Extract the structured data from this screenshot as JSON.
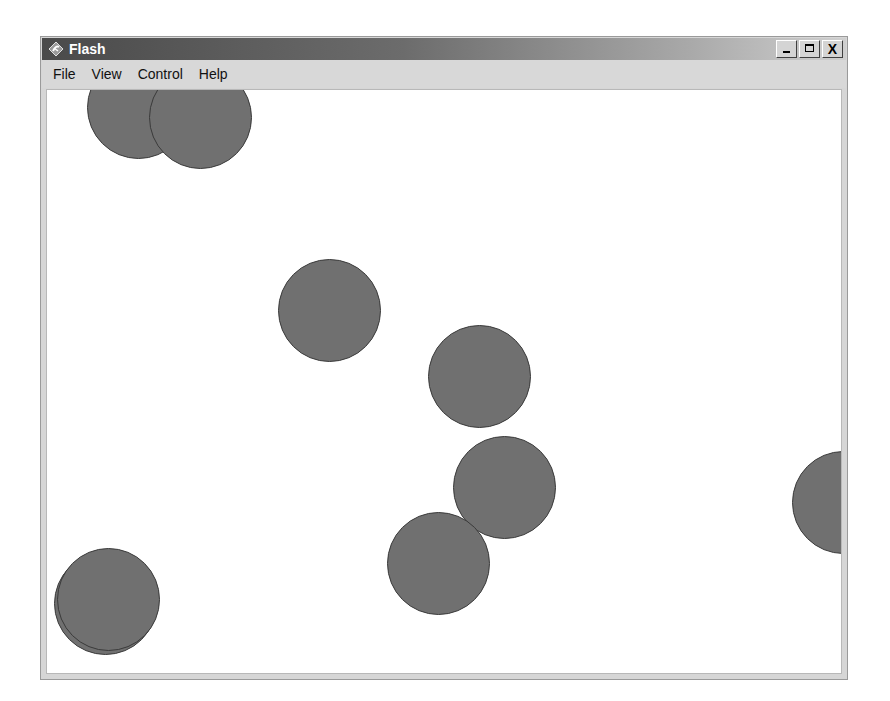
{
  "window": {
    "title": "Flash",
    "app_icon": "flash-player-icon",
    "controls": {
      "minimize": "minimize",
      "maximize": "maximize",
      "close": "X"
    }
  },
  "menubar": {
    "items": [
      {
        "label": "File"
      },
      {
        "label": "View"
      },
      {
        "label": "Control"
      },
      {
        "label": "Help"
      }
    ]
  },
  "stage": {
    "background": "#ffffff",
    "ball_color": "#707070",
    "ball_border": "#3a3a3a",
    "ball_diameter": 103,
    "balls": [
      {
        "id": "ball-1",
        "cx": 137,
        "cy": 106
      },
      {
        "id": "ball-2",
        "cx": 199,
        "cy": 116
      },
      {
        "id": "ball-3",
        "cx": 328,
        "cy": 309
      },
      {
        "id": "ball-4",
        "cx": 478,
        "cy": 375
      },
      {
        "id": "ball-5",
        "cx": 503,
        "cy": 486
      },
      {
        "id": "ball-6",
        "cx": 437,
        "cy": 562
      },
      {
        "id": "ball-7",
        "cx": 842,
        "cy": 501
      },
      {
        "id": "ball-8",
        "cx": 104,
        "cy": 602
      },
      {
        "id": "ball-9",
        "cx": 107,
        "cy": 598
      }
    ]
  }
}
